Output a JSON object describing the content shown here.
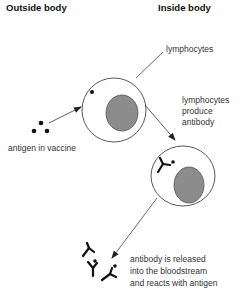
{
  "headings": {
    "outside": "Outside body",
    "inside": "Inside body"
  },
  "labels": {
    "lymphocytes": "lymphocytes",
    "produce_1": "lymphocytes",
    "produce_2": "produce",
    "produce_3": "antibody",
    "antigen": "antigen in vaccine",
    "released_1": "antibody is released",
    "released_2": "into the bloodstream",
    "released_3": "and reacts with antigen"
  },
  "colors": {
    "nucleus": "#8c8c8c",
    "outline": "#444444",
    "ink": "#111111"
  }
}
